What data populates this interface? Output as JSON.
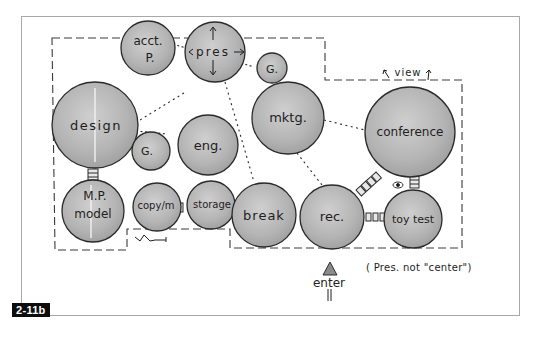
{
  "figure": {
    "label": "2-11b",
    "type": "bubble-diagram",
    "colors": {
      "bubble_fill": "#b9b9b9",
      "bubble_stroke": "#2a2a2a",
      "dashed_boundary": "#3a3a3a",
      "frame_border": "#a8a8a8",
      "label_bg": "#0d0d0d"
    }
  },
  "bubbles": [
    {
      "id": "acct",
      "label": "acct.",
      "sublabel": "P.",
      "cx": 148,
      "cy": 48,
      "r": 27
    },
    {
      "id": "pres",
      "label": "pres",
      "cx": 215,
      "cy": 52,
      "r": 30
    },
    {
      "id": "g-top",
      "label": "G.",
      "cx": 272,
      "cy": 68,
      "r": 15
    },
    {
      "id": "design",
      "label": "design",
      "cx": 95,
      "cy": 125,
      "r": 43
    },
    {
      "id": "g-left",
      "label": "G.",
      "cx": 151,
      "cy": 151,
      "r": 19
    },
    {
      "id": "eng",
      "label": "eng.",
      "cx": 208,
      "cy": 145,
      "r": 30
    },
    {
      "id": "mktg",
      "label": "mktg.",
      "cx": 288,
      "cy": 118,
      "r": 36
    },
    {
      "id": "conference",
      "label": "conference",
      "cx": 410,
      "cy": 132,
      "r": 45
    },
    {
      "id": "model",
      "label": "model",
      "sublabel": "M.P.",
      "cx": 93,
      "cy": 211,
      "r": 31
    },
    {
      "id": "copy",
      "label": "copy/m",
      "cx": 157,
      "cy": 207,
      "r": 24
    },
    {
      "id": "storage",
      "label": "storage",
      "cx": 211,
      "cy": 205,
      "r": 24
    },
    {
      "id": "break",
      "label": "break",
      "cx": 264,
      "cy": 215,
      "r": 32
    },
    {
      "id": "rec",
      "label": "rec.",
      "cx": 332,
      "cy": 217,
      "r": 32
    },
    {
      "id": "toytest",
      "label": "toy test",
      "cx": 413,
      "cy": 219,
      "r": 29
    }
  ],
  "annotations": {
    "view": "view",
    "enter": "enter",
    "note": "( Pres. not \"center\")",
    "squiggle": "~"
  },
  "connections": [
    {
      "from": "acct",
      "to": "pres",
      "kind": "adjacent-chain"
    },
    {
      "from": "pres",
      "to": "mktg",
      "kind": "adjacent-chain"
    },
    {
      "from": "pres",
      "to": "design",
      "kind": "dotted"
    },
    {
      "from": "pres",
      "to": "eng",
      "kind": "touch"
    },
    {
      "from": "pres",
      "to": "break",
      "kind": "dotted"
    },
    {
      "from": "design",
      "to": "g-left",
      "kind": "adjacent-chain"
    },
    {
      "from": "design",
      "to": "model",
      "kind": "direct-link"
    },
    {
      "from": "mktg",
      "to": "conference",
      "kind": "dotted"
    },
    {
      "from": "mktg",
      "to": "rec",
      "kind": "dotted"
    },
    {
      "from": "rec",
      "to": "conference",
      "kind": "direct-link"
    },
    {
      "from": "rec",
      "to": "toytest",
      "kind": "direct-link"
    },
    {
      "from": "conference",
      "to": "toytest",
      "kind": "direct-link"
    },
    {
      "from": "copy",
      "to": "storage",
      "kind": "direct-link"
    }
  ]
}
